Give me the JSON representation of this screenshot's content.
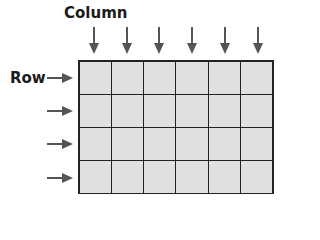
{
  "diagram": {
    "column_label": "Column",
    "row_label": "Row",
    "columns": 6,
    "rows": 4,
    "cell_fill": "#e0e0e0",
    "line_color": "#222222",
    "arrow_color": "#555555"
  }
}
